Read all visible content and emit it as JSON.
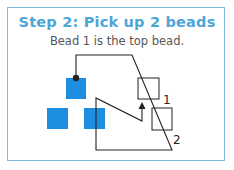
{
  "title": "Step 2: Pick up 2 beads",
  "subtitle": "Bead 1 is the top bead.",
  "colors": {
    "title": "#4da6d8",
    "border": "#7fbcdc",
    "bead": "#1e8fe0",
    "thread": "#222222"
  },
  "diagram": {
    "labels": [
      "1",
      "2"
    ],
    "beads_filled": 3,
    "beads_outline": 2
  }
}
